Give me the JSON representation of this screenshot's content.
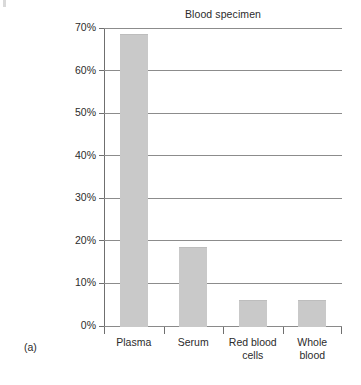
{
  "figure": {
    "panel_label": "(a)",
    "background_color": "#ffffff"
  },
  "chart_data": {
    "type": "bar",
    "title": "Blood specimen",
    "xlabel": "",
    "ylabel": "",
    "categories": [
      "Plasma",
      "Serum",
      "Red blood cells",
      "Whole blood"
    ],
    "category_lines": [
      [
        "Plasma"
      ],
      [
        "Serum"
      ],
      [
        "Red blood",
        "cells"
      ],
      [
        "Whole",
        "blood"
      ]
    ],
    "values": [
      68.5,
      18.5,
      6.0,
      6.0
    ],
    "value_labels": [
      "68.5%",
      "18.5%",
      "6%",
      "6%"
    ],
    "ylim": [
      0,
      70
    ],
    "yticks": [
      0,
      10,
      20,
      30,
      40,
      50,
      60,
      70
    ],
    "ytick_labels": [
      "0%",
      "10%",
      "20%",
      "30%",
      "40%",
      "50%",
      "60%",
      "70%"
    ],
    "grid": true,
    "grid_axis": "y",
    "legend": false,
    "bar_color": "#c9c9c9",
    "grid_color": "#8c8c8c",
    "axis_color": "#6f6f6f",
    "text_color": "#2b2b2b"
  }
}
